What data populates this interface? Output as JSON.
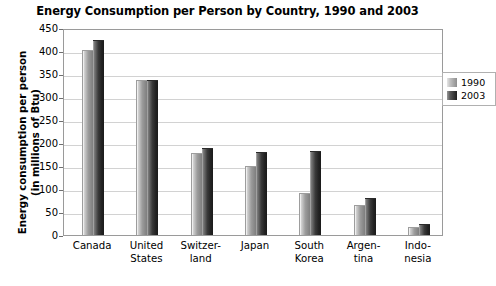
{
  "chart_data": {
    "type": "bar",
    "title": "Energy Consumption per Person by Country, 1990 and 2003",
    "xlabel": "",
    "ylabel": "Energy consumption per person\n(in millions of Btu)",
    "ylabel_line1": "Energy consumption per person",
    "ylabel_line2": "(in millions of Btu)",
    "ylim": [
      0,
      450
    ],
    "ytick_step": 50,
    "yticks": [
      450,
      400,
      350,
      300,
      250,
      200,
      150,
      100,
      50,
      0
    ],
    "ytick_labels": [
      "450",
      "400",
      "350",
      "300",
      "250",
      "200",
      "150",
      "100",
      "50",
      "0"
    ],
    "grid": true,
    "grid_axis": "y",
    "legend_position": "top-right",
    "categories": [
      "Canada",
      "United States",
      "Switzerland",
      "Japan",
      "South Korea",
      "Argentina",
      "Indonesia"
    ],
    "category_labels": [
      {
        "line1": "Canada",
        "line2": ""
      },
      {
        "line1": "United",
        "line2": "States"
      },
      {
        "line1": "Switzer-",
        "line2": "land"
      },
      {
        "line1": "Japan",
        "line2": ""
      },
      {
        "line1": "South",
        "line2": "Korea"
      },
      {
        "line1": "Argen-",
        "line2": "tina"
      },
      {
        "line1": "Indo-",
        "line2": "nesia"
      }
    ],
    "series": [
      {
        "name": "1990",
        "color": "#9c9c9c",
        "values": [
          403,
          338,
          178,
          150,
          92,
          65,
          17
        ]
      },
      {
        "name": "2003",
        "color": "#2b2b2b",
        "values": [
          423,
          338,
          190,
          180,
          183,
          80,
          24
        ]
      }
    ]
  },
  "legend": {
    "items": [
      {
        "label": "1990",
        "swatch": "legend-swatch-1990"
      },
      {
        "label": "2003",
        "swatch": "legend-swatch-2003"
      }
    ]
  }
}
